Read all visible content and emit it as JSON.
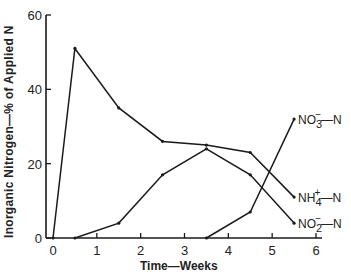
{
  "chart_data": {
    "type": "line",
    "title": "",
    "xlabel": "Time—Weeks",
    "ylabel": "Inorganic Nitrogen—% of Applied N",
    "xlim": [
      0,
      6
    ],
    "ylim": [
      0,
      60
    ],
    "x_ticks": [
      "0",
      "1",
      "2",
      "3",
      "4",
      "5",
      "6"
    ],
    "y_ticks": [
      "0",
      "20",
      "40",
      "60"
    ],
    "grid": false,
    "legend_position": "inline labels at right end of each line",
    "series": [
      {
        "name": "NH4+—N",
        "label_main": "NH",
        "label_sup": "+",
        "label_sub": "4",
        "label_tail": "—N",
        "x": [
          0,
          0.5,
          1.5,
          2.5,
          3.5,
          4.5,
          5.5
        ],
        "values": [
          0,
          51,
          35,
          26,
          25,
          23,
          11
        ]
      },
      {
        "name": "NO2-—N",
        "label_main": "NO",
        "label_sup": "−",
        "label_sub": "2",
        "label_tail": "—N",
        "x": [
          0.5,
          1.5,
          2.5,
          3.5,
          4.5,
          5.5
        ],
        "values": [
          0,
          4,
          17,
          24,
          17,
          4
        ]
      },
      {
        "name": "NO3-—N",
        "label_main": "NO",
        "label_sup": "−",
        "label_sub": "3",
        "label_tail": "—N",
        "x": [
          3.5,
          4.5,
          5.5
        ],
        "values": [
          0,
          7,
          32
        ]
      }
    ]
  },
  "axes": {
    "xlabel": "Time—Weeks",
    "ylabel": "Inorganic  Nitrogen—% of  Applied  N"
  }
}
